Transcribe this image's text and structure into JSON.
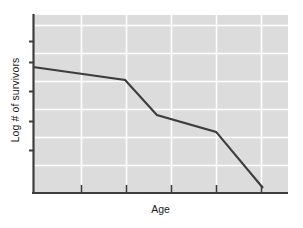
{
  "chart_data": {
    "type": "line",
    "title": "",
    "subtitle": "",
    "xlabel": "Age",
    "ylabel": "Log # of survivors",
    "grid": true,
    "legend": null,
    "axis_tick_labels": {
      "x": [],
      "y": []
    },
    "xlim": [
      0,
      100
    ],
    "ylim": [
      0,
      100
    ],
    "series": [
      {
        "name": "survivorship",
        "color": "#3d3d3d",
        "points": [
          {
            "x": 0.0,
            "y": 70.8
          },
          {
            "x": 36.1,
            "y": 63.5
          },
          {
            "x": 48.6,
            "y": 43.8
          },
          {
            "x": 71.8,
            "y": 34.3
          },
          {
            "x": 90.2,
            "y": 2.8
          }
        ]
      }
    ],
    "gridlines": {
      "x": [
        18.8,
        36.5,
        54.1,
        71.8,
        89.4
      ],
      "y": [
        15.7,
        31.5,
        47.2,
        62.9,
        78.7,
        94.4
      ]
    },
    "axis_ticks": {
      "x": [
        18.8,
        36.5,
        54.1,
        71.8,
        89.4
      ],
      "y": [
        24.2,
        40.4,
        57.3,
        73.6,
        85.4
      ]
    },
    "colors": {
      "plot_background": "#dcdcdc",
      "gridline": "#ffffff",
      "axis": "#3d3d3d",
      "line": "#3d3d3d",
      "page_background": "#ffffff",
      "text": "#1a1a1a"
    }
  },
  "figure": {
    "axis_label_x": "Age",
    "axis_label_y": "Log # of survivors"
  }
}
